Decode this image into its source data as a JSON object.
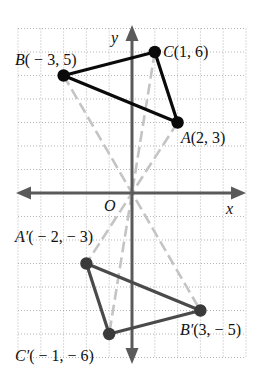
{
  "diagram": {
    "type": "coordinate-plane-point-reflection",
    "grid": {
      "x_range": [
        -5,
        5
      ],
      "y_range": [
        -7,
        7
      ],
      "step": 1
    },
    "axes": {
      "x_label": "x",
      "y_label": "y",
      "origin_label": "O"
    },
    "original_triangle": {
      "color": "#0a0a0a",
      "points": [
        {
          "name": "A",
          "x": 2,
          "y": 3,
          "letter": "A",
          "coords": "(2, 3)"
        },
        {
          "name": "B",
          "x": -3,
          "y": 5,
          "letter": "B",
          "coords": "( − 3, 5)"
        },
        {
          "name": "C",
          "x": 1,
          "y": 6,
          "letter": "C",
          "coords": "(1, 6)"
        }
      ]
    },
    "image_triangle": {
      "color": "#4a4a4a",
      "points": [
        {
          "name": "A′",
          "x": -2,
          "y": -3,
          "letter": "A′",
          "coords": "( − 2, − 3)"
        },
        {
          "name": "B′",
          "x": 3,
          "y": -5,
          "letter": "B′",
          "coords": "(3, − 5)"
        },
        {
          "name": "C′",
          "x": -1,
          "y": -6,
          "letter": "C′",
          "coords": "( − 1, − 6)"
        }
      ]
    },
    "correspondence_lines": [
      {
        "from": "A",
        "to": "A′",
        "style": "dashed"
      },
      {
        "from": "B",
        "to": "B′",
        "style": "dashed"
      },
      {
        "from": "C",
        "to": "C′",
        "style": "dashed"
      }
    ]
  },
  "labels": {
    "y_axis": "y",
    "x_axis": "x",
    "origin": "O",
    "A": {
      "letter": "A",
      "coords": "(2, 3)"
    },
    "B": {
      "letter": "B",
      "coords": "( − 3, 5)"
    },
    "C": {
      "letter": "C",
      "coords": "(1, 6)"
    },
    "A_prime": {
      "letter": "A′",
      "coords": "( − 2, − 3)"
    },
    "B_prime": {
      "letter": "B′",
      "coords": "(3, − 5)"
    },
    "C_prime": {
      "letter": "C′",
      "coords": "( − 1, − 6)"
    }
  }
}
